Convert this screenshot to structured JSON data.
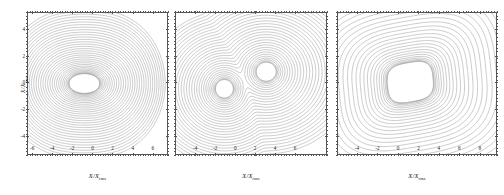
{
  "figure": {
    "background_color": "#ffffff",
    "contour_color": "#7a7a7a",
    "frame_color": "#555555"
  },
  "axes_titles": {
    "x_main": "X/X",
    "x_sub": "rms",
    "y_main": "X/X",
    "y_sub": "rms"
  },
  "chart_data": [
    {
      "type": "heatmap",
      "panel_index": 1,
      "title": "",
      "xlabel": "X/X_rms",
      "ylabel": "X/X_rms",
      "xlim": [
        -7,
        7
      ],
      "ylim": [
        -5.2,
        5.2
      ],
      "xticks": [
        -6,
        -4,
        -2,
        0,
        2,
        4,
        6
      ],
      "xticklabels": [
        "-6",
        "-4",
        "-2",
        "0",
        "2",
        "4",
        "6"
      ],
      "yticks": [
        -4,
        -2,
        0,
        2,
        4
      ],
      "yticklabels": [
        "-4",
        "-2",
        "0",
        "2",
        "4"
      ],
      "grid": false,
      "legend": "none",
      "contour_shape": "single elliptical well, elongated along x, centre offset left of origin",
      "center": [
        -1.3,
        0.0
      ],
      "inner_contour_semi_axes": [
        2.3,
        1.0
      ],
      "n_contour_levels": 34,
      "level_spacing": "uniform",
      "density_note": "contours crowd densely toward all four edges producing uniform grey shading"
    },
    {
      "type": "heatmap",
      "panel_index": 2,
      "title": "",
      "xlabel": "X/X_rms",
      "ylabel": "",
      "xlim": [
        -7,
        9
      ],
      "ylim": [
        -5.2,
        5.2
      ],
      "xticks": [
        -4,
        -2,
        0,
        2,
        4,
        6
      ],
      "xticklabels": [
        "-4",
        "-2",
        "0",
        "2",
        "4",
        "6"
      ],
      "yticks": [
        -4,
        -2,
        0,
        2,
        4
      ],
      "yticklabels": [
        "",
        "",
        "",
        "",
        ""
      ],
      "grid": false,
      "legend": "none",
      "contour_shape": "peanut / dumbbell double-lobed well, lobes at lower-left and upper-right joined by narrow waist",
      "lobe_centers": [
        [
          -1.8,
          -0.4
        ],
        [
          2.6,
          0.9
        ]
      ],
      "n_contour_levels": 30,
      "level_spacing": "uniform",
      "density_note": "dense dark contour crowding along left and right edges"
    },
    {
      "type": "heatmap",
      "panel_index": 3,
      "title": "",
      "xlabel": "X/X_rms",
      "ylabel": "",
      "xlim": [
        -6.5,
        9
      ],
      "ylim": [
        -5.2,
        5.2
      ],
      "xticks": [
        -4,
        -2,
        0,
        2,
        4,
        6,
        8
      ],
      "xticklabels": [
        "-4",
        "-2",
        "0",
        "2",
        "4",
        "6",
        "8"
      ],
      "yticks": [
        -4,
        -2,
        0,
        2,
        4
      ],
      "yticklabels": [
        "",
        "",
        "",
        "",
        ""
      ],
      "grid": false,
      "legend": "none",
      "contour_shape": "single broad rounded-rectangular well, slightly tilted, flat-topped plateau",
      "center": [
        0.6,
        0.1
      ],
      "inner_contour_semi_axes": [
        2.8,
        1.8
      ],
      "n_contour_levels": 28,
      "level_spacing": "uniform",
      "density_note": "strong dark contour crowding along left and right edges, lighter top and bottom"
    }
  ],
  "panels": [
    {
      "name": "panel-1",
      "left": 27,
      "width": 141,
      "xticklabels": [
        "-6",
        "-4",
        "-2",
        "0",
        "2",
        "4",
        "6"
      ],
      "xtick_fracs": [
        0.036,
        0.178,
        0.32,
        0.464,
        0.606,
        0.75,
        0.892
      ],
      "yticklabels": [
        "4",
        "2",
        "0",
        "-2",
        "-4"
      ],
      "ytick_fracs": [
        0.118,
        0.305,
        0.492,
        0.68,
        0.867
      ],
      "show_yticklabels": true,
      "show_ytitle": true
    },
    {
      "name": "panel-2",
      "left": 175,
      "width": 152,
      "xticklabels": [
        "-4",
        "-2",
        "0",
        "2",
        "4",
        "6"
      ],
      "xtick_fracs": [
        0.133,
        0.264,
        0.396,
        0.527,
        0.659,
        0.79
      ],
      "yticklabels": [
        "",
        "",
        "",
        "",
        ""
      ],
      "ytick_fracs": [
        0.118,
        0.305,
        0.492,
        0.68,
        0.867
      ],
      "show_yticklabels": false,
      "show_ytitle": false
    },
    {
      "name": "panel-3",
      "left": 337,
      "width": 160,
      "xticklabels": [
        "-4",
        "-2",
        "0",
        "2",
        "4",
        "6",
        "8"
      ],
      "xtick_fracs": [
        0.125,
        0.253,
        0.381,
        0.509,
        0.637,
        0.765,
        0.893
      ],
      "yticklabels": [
        "",
        "",
        "",
        "",
        ""
      ],
      "ytick_fracs": [
        0.118,
        0.305,
        0.492,
        0.68,
        0.867
      ],
      "show_yticklabels": false,
      "show_ytitle": false
    }
  ]
}
